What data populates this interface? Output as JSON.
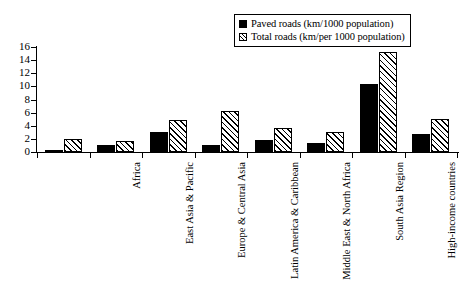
{
  "chart_data": {
    "type": "bar",
    "title": "",
    "subtitle": "",
    "xlabel": "",
    "ylabel": "",
    "ylim": [
      0,
      16
    ],
    "yticks": [
      0,
      2,
      4,
      6,
      8,
      10,
      12,
      14,
      16
    ],
    "grid": false,
    "legend_position": "top-right",
    "categories": [
      "Africa",
      "East Asia & Pacific",
      "Europe & Central Asia",
      "Latin America & Caribbean",
      "Middle East & North Africa",
      "South Asia Region",
      "High-income countries",
      "Global total"
    ],
    "series": [
      {
        "name": "Paved roads (km/1000 population)",
        "style": "solid-black",
        "color": "#000000",
        "values": [
          0.3,
          1.1,
          3.1,
          1.0,
          1.8,
          1.4,
          10.4,
          2.8
        ]
      },
      {
        "name": "Total roads (km/per 1000 population)",
        "style": "diagonal-hatch",
        "color": "#ffffff",
        "values": [
          2.0,
          1.7,
          4.9,
          6.3,
          3.7,
          3.0,
          15.2,
          5.0
        ]
      }
    ]
  },
  "legend": {
    "items": [
      {
        "label": "Paved roads (km/1000 population)",
        "swatch": "solid-swatch"
      },
      {
        "label": "Total roads (km/per 1000 population)",
        "swatch": "hatched-swatch"
      }
    ]
  },
  "axis": {
    "y_tick_labels": [
      "16",
      "14",
      "12",
      "10",
      "8",
      "6",
      "4",
      "2",
      "0"
    ]
  }
}
